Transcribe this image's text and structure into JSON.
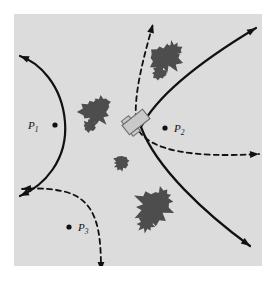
{
  "figure": {
    "title": "",
    "background_color": "#ffffff",
    "field_color": "#dcdcdc",
    "obstacle_color": "#4d4d4d",
    "curve_color": "#111111",
    "robot_body_color": "#c9c9c9",
    "robot_outline_color": "#6e6e6e",
    "field": {
      "x": 14,
      "y": 14,
      "width": 248,
      "height": 252
    }
  },
  "labels": [
    {
      "id": "P1",
      "text": "P",
      "subscript": "1",
      "x": 28,
      "y": 120,
      "dot_side": "right",
      "dot_x": 55,
      "dot_y": 125
    },
    {
      "id": "P2",
      "text": "P",
      "subscript": "2",
      "x": 174,
      "y": 123,
      "dot_side": "left",
      "dot_x": 165,
      "dot_y": 128
    },
    {
      "id": "P3",
      "text": "P",
      "subscript": "3",
      "x": 78,
      "y": 222,
      "dot_side": "left",
      "dot_x": 69,
      "dot_y": 227
    }
  ],
  "robot": {
    "name": "mobile-robot",
    "x": 136,
    "y": 122,
    "rotation_deg": -38,
    "width": 26,
    "height": 12
  },
  "obstacles": [
    {
      "id": "obstacle-upper",
      "cx": 165,
      "cy": 58,
      "scale": 1.15
    },
    {
      "id": "obstacle-left",
      "cx": 95,
      "cy": 112,
      "scale": 1.05
    },
    {
      "id": "obstacle-center-small",
      "cx": 121,
      "cy": 163,
      "scale": 0.6
    },
    {
      "id": "obstacle-lower",
      "cx": 153,
      "cy": 207,
      "scale": 1.3
    }
  ],
  "curves": {
    "solid": [
      {
        "id": "left-hyperbola-branch",
        "style": "solid",
        "path": "M 20 56 C 38 62 62 84 65 122 C 68 160 44 186 20 196",
        "arrows": [
          "start",
          "end"
        ]
      },
      {
        "id": "right-hyperbola-branch",
        "style": "solid",
        "path": "M 256 28 C 216 52 160 90 141 127 C 156 168 206 214 250 246",
        "arrows": [
          "start",
          "end"
        ]
      }
    ],
    "dashed": [
      {
        "id": "dashed-up-path",
        "style": "dashed",
        "path": "M 136 119 C 134 92 144 56 153 24",
        "arrows": [
          "end"
        ]
      },
      {
        "id": "dashed-right-path",
        "style": "dashed",
        "path": "M 139 131 C 152 150 190 158 259 154",
        "arrows": [
          "end"
        ]
      },
      {
        "id": "dashed-lower-left-path",
        "style": "dashed",
        "path": "M 101 271 C 101 232 98 201 66 192 C 50 188 33 188 22 189",
        "arrows": [
          "start",
          "end"
        ]
      }
    ]
  }
}
